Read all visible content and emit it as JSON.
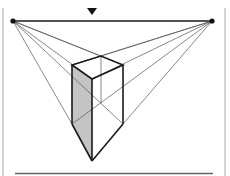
{
  "diagram": {
    "colors": {
      "line": "#1a1a1a",
      "thin_line": "#555555",
      "shade": "#c4c4c4",
      "border": "#aaaaaa",
      "background": "#ffffff"
    },
    "vanishing_points": {
      "left": [
        13,
        21
      ],
      "right": [
        212,
        21
      ]
    },
    "horizon_y": 21,
    "eye_marker": {
      "shape": "down-triangle",
      "x": 92,
      "y": 11
    },
    "box": {
      "top_left": [
        72,
        65
      ],
      "top_back": [
        101,
        56
      ],
      "top_right": [
        123,
        65
      ],
      "top_front": [
        92,
        79
      ],
      "bottom_left": [
        72,
        124
      ],
      "bottom_right": [
        123,
        124
      ],
      "bottom_front": [
        92,
        161
      ]
    }
  }
}
